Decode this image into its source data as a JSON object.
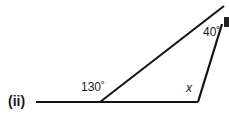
{
  "figure": {
    "part_label": "(ii)",
    "angles": {
      "exterior": "130˚",
      "top": "40˚",
      "unknown": "x"
    }
  },
  "colors": {
    "line": "#111111",
    "background": "#ffffff"
  }
}
